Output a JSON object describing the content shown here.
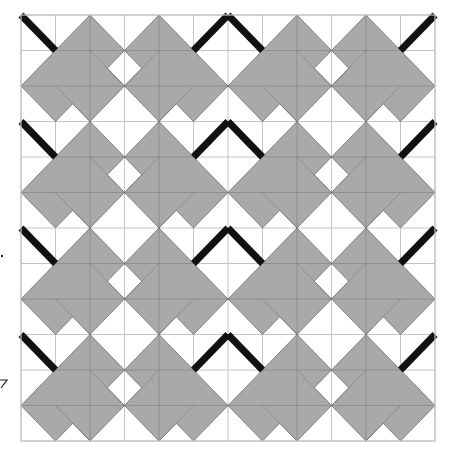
{
  "figure": {
    "kind": "tessellation-grid",
    "canvas": {
      "width": 450,
      "height": 460,
      "background": "#ffffff"
    },
    "grid": {
      "origin_x": 21,
      "origin_y": 15,
      "cols": 12,
      "rows": 12,
      "cell_width": 34.5,
      "cell_height": 35.5,
      "line_color": "#c4c4c4",
      "line_width": 1
    },
    "colors": {
      "tile_fill": "#a9a9a9",
      "tile_edge": "#6e6e6e",
      "internal_line": "#5a5a5a",
      "accent_stroke": "#111111"
    },
    "repeat": {
      "band_height_rows": 3,
      "bands": 4,
      "period_cols": 6,
      "periods": 2
    },
    "motif": {
      "gray_polygons": [
        {
          "name": "left-tile-cluster",
          "points": [
            [
              2,
              0
            ],
            [
              1,
              1
            ],
            [
              0,
              2
            ],
            [
              1,
              3
            ],
            [
              1.5,
              2.5
            ],
            [
              2,
              3
            ],
            [
              3,
              2
            ],
            [
              2.5,
              1.5
            ],
            [
              3,
              1
            ]
          ]
        },
        {
          "name": "right-tile-cluster",
          "points": [
            [
              4,
              0
            ],
            [
              5,
              1
            ],
            [
              6,
              2
            ],
            [
              5,
              3
            ],
            [
              4.5,
              2.5
            ],
            [
              4,
              3
            ],
            [
              3,
              2
            ],
            [
              3.5,
              1.5
            ],
            [
              3,
              1
            ]
          ]
        }
      ],
      "internal_lines": [
        {
          "name": "left-seam-lower",
          "from": [
            1,
            2
          ],
          "to": [
            2,
            3
          ]
        },
        {
          "name": "left-seam-upper",
          "from": [
            2,
            1
          ],
          "to": [
            3,
            2
          ]
        },
        {
          "name": "right-seam-lower",
          "from": [
            5,
            2
          ],
          "to": [
            4,
            3
          ]
        },
        {
          "name": "right-seam-upper",
          "from": [
            4,
            1
          ],
          "to": [
            3,
            2
          ]
        },
        {
          "name": "left-vertical-seam",
          "from": [
            2,
            0
          ],
          "to": [
            2,
            3
          ]
        },
        {
          "name": "right-vertical-seam",
          "from": [
            4,
            0
          ],
          "to": [
            4,
            3
          ]
        },
        {
          "name": "left-horizontal-seam",
          "from": [
            1,
            1
          ],
          "to": [
            3,
            1
          ]
        },
        {
          "name": "right-horizontal-seam",
          "from": [
            3,
            1
          ],
          "to": [
            5,
            1
          ]
        },
        {
          "name": "mid-horizontal-seam",
          "from": [
            0,
            2
          ],
          "to": [
            6,
            2
          ]
        }
      ],
      "accent_strokes": [
        {
          "name": "descending-stroke",
          "points": [
            [
              0,
              0
            ],
            [
              1,
              1
            ]
          ]
        },
        {
          "name": "ascending-stroke",
          "points": [
            [
              5,
              1
            ],
            [
              6,
              0
            ]
          ]
        }
      ],
      "stroke_width": 7
    },
    "margin_marks": [
      {
        "name": "margin-dot",
        "x": 1,
        "y": 255,
        "w": 2,
        "h": 2
      },
      {
        "name": "margin-tick-seven",
        "points": [
          [
            0,
            380
          ],
          [
            7,
            380
          ],
          [
            1,
            388
          ]
        ]
      }
    ]
  }
}
